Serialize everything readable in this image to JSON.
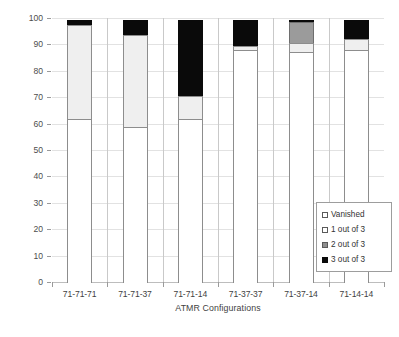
{
  "chart_data": {
    "type": "bar",
    "subtype": "stacked-column-100",
    "title": "",
    "xlabel": "ATMR Configurations",
    "ylabel": "Error Distribution [%]",
    "ylim": [
      0,
      100
    ],
    "ytick_step": 10,
    "yticks": [
      0,
      10,
      20,
      30,
      40,
      50,
      60,
      70,
      80,
      90,
      100
    ],
    "ytick_labels": [
      "0",
      "10",
      "20",
      "30",
      "40",
      "50",
      "60",
      "70",
      "80",
      "90",
      "100"
    ],
    "grid": "horizontal",
    "legend_position": "inside-bottom-right",
    "categories": [
      "71-71-71",
      "71-71-37",
      "71-71-14",
      "71-37-37",
      "71-37-14",
      "71-14-14"
    ],
    "series": [
      {
        "name": "Vanished",
        "color": "#ffffff",
        "values": [
          62.0,
          59.0,
          62.0,
          88.0,
          87.5,
          88.0
        ]
      },
      {
        "name": "1 out of 3",
        "color": "#efefef",
        "values": [
          36.0,
          35.0,
          9.0,
          2.0,
          3.5,
          4.5
        ]
      },
      {
        "name": "2 out of 3",
        "color": "#9b9b9b",
        "values": [
          0.0,
          0.0,
          0.0,
          0.0,
          8.5,
          0.0
        ]
      },
      {
        "name": "3 out of 3",
        "color": "#0a0a0a",
        "values": [
          2.0,
          6.0,
          29.0,
          10.0,
          1.0,
          7.5
        ]
      }
    ]
  },
  "legend": {
    "items": [
      {
        "label": "Vanished",
        "swatch": "sw-vanished"
      },
      {
        "label": "1 out of 3",
        "swatch": "sw-one"
      },
      {
        "label": "2 out of 3",
        "swatch": "sw-two"
      },
      {
        "label": "3 out of 3",
        "swatch": "sw-three"
      }
    ]
  }
}
